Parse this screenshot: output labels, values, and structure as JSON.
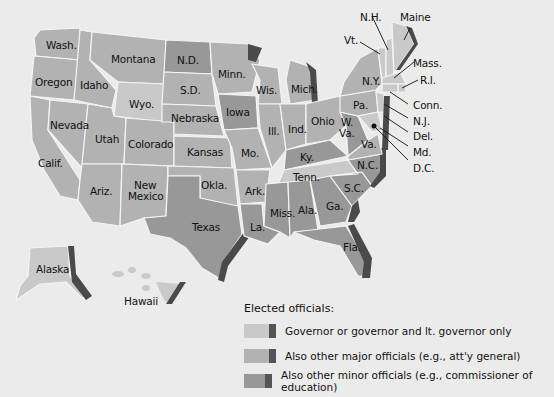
{
  "colors": {
    "background": "#ebebeb",
    "governor_only": "#c9c9c9",
    "major_officials": "#b2b2b2",
    "minor_officials": "#989898",
    "coast_edge": "#4a4a4a",
    "border": "#f4f4f4"
  },
  "states": {
    "wash": "Wash.",
    "oregon": "Oregon",
    "calif": "Calif.",
    "idaho": "Idaho",
    "nevada": "Nevada",
    "montana": "Montana",
    "wyo": "Wyo.",
    "utah": "Utah",
    "ariz": "Ariz.",
    "colorado": "Colorado",
    "new_mexico_1": "New",
    "new_mexico_2": "Mexico",
    "nd": "N.D.",
    "sd": "S.D.",
    "nebraska": "Nebraska",
    "kansas": "Kansas",
    "okla": "Okla.",
    "texas": "Texas",
    "minn": "Minn.",
    "iowa": "Iowa",
    "mo": "Mo.",
    "ark": "Ark.",
    "la": "La.",
    "wis": "Wis.",
    "ill": "Ill.",
    "mich": "Mich.",
    "ind": "Ind.",
    "ohio": "Ohio",
    "ky": "Ky.",
    "tenn": "Tenn.",
    "miss": "Miss.",
    "ala": "Ala.",
    "ga": "Ga.",
    "fla": "Fla.",
    "sc": "S.C.",
    "nc": "N.C.",
    "va": "Va.",
    "wva_1": "W.",
    "wva_2": "Va.",
    "pa": "Pa.",
    "ny": "N.Y.",
    "vt": "Vt.",
    "nh": "N.H.",
    "maine": "Maine",
    "mass": "Mass.",
    "ri": "R.I.",
    "conn": "Conn.",
    "nj": "N.J.",
    "del": "Del.",
    "md": "Md.",
    "dc": "D.C.",
    "alaska": "Alaska",
    "hawaii": "Hawaii"
  },
  "legend": {
    "title": "Elected officials:",
    "items": [
      {
        "label": "Governor or governor and lt. governor only",
        "color": "#c9c9c9"
      },
      {
        "label": "Also other major officials (e.g., att'y general)",
        "color": "#b2b2b2"
      },
      {
        "label": "Also other minor officials (e.g., commissioner of education)",
        "color": "#989898"
      }
    ]
  }
}
